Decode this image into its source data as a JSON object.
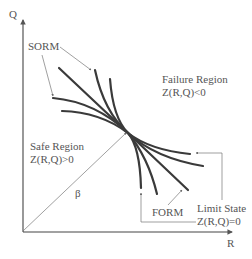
{
  "diagram": {
    "axes": {
      "x_label": "R",
      "y_label": "Q"
    },
    "regions": {
      "failure": {
        "title": "Failure Region",
        "condition": "Z(R,Q)<0"
      },
      "safe": {
        "title": "Safe Region",
        "condition": "Z(R,Q)>0"
      }
    },
    "annotations": {
      "sorm": "SORM",
      "form": "FORM",
      "limit_state_title": "Limit State",
      "limit_state_condition": "Z(R,Q)=0",
      "beta": "β"
    },
    "colors": {
      "curve": "#3a3a3a",
      "text": "#555555",
      "leader": "#777777"
    }
  }
}
